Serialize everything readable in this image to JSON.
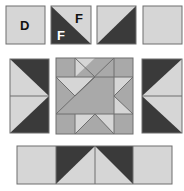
{
  "colors": {
    "light": "#d6d6d6",
    "medium": "#a9a9a9",
    "dark": "#3a3a3a",
    "outline": "#6e6e6e",
    "label_dark": "#111111",
    "label_light": "#ffffff"
  },
  "top_row": {
    "units": [
      {
        "name": "square-d",
        "kind": "plain-light",
        "label": "D"
      },
      {
        "name": "hst-f",
        "kind": "hst-dark-bottom-left",
        "labels": [
          "F",
          "F"
        ]
      },
      {
        "name": "hst-light-dark",
        "kind": "hst-dark-bottom-right"
      },
      {
        "name": "square-plain",
        "kind": "plain-light"
      }
    ]
  },
  "middle_row": {
    "left_panel": "flying-geese-pointing-right",
    "center_block": "star-block",
    "right_panel": "flying-geese-pointing-left"
  },
  "bottom_row": {
    "units": [
      "plain-light",
      "flying-goose-left-half",
      "flying-goose-right-half",
      "plain-light"
    ]
  }
}
